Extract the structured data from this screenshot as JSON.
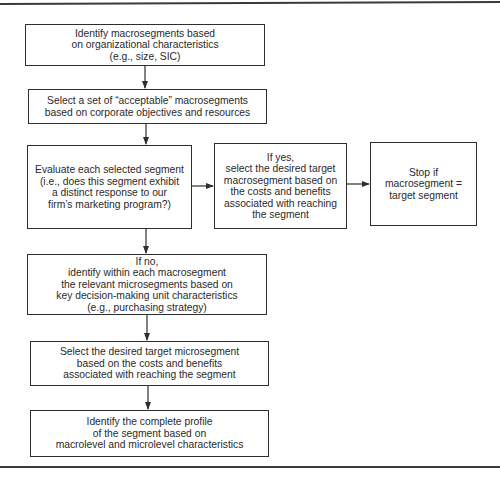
{
  "diagram": {
    "type": "flowchart",
    "nodes": [
      {
        "id": "macro",
        "text": "Identify macrosegments based\non organizational characteristics\n(e.g., size, SIC)"
      },
      {
        "id": "acceptable",
        "text": "Select a set of “acceptable” macrosegments\nbased on corporate objectives and resources"
      },
      {
        "id": "evaluate",
        "text": "Evaluate each selected segment\n(i.e., does this segment exhibit\na distinct response to our\nfirm’s marketing program?)"
      },
      {
        "id": "if_yes",
        "text": "If yes,\nselect the desired target\nmacrosegment based on\nthe costs and benefits\nassociated with reaching\nthe segment"
      },
      {
        "id": "stop",
        "text": "Stop if\nmacrosegment =\ntarget segment"
      },
      {
        "id": "if_no",
        "text": "If no,\nidentify within each macrosegment\nthe relevant microsegments based on\nkey decision-making unit characteristics\n(e.g., purchasing strategy)"
      },
      {
        "id": "micro_target",
        "text": "Select the desired target microsegment\nbased on the costs and benefits\nassociated with reaching the segment"
      },
      {
        "id": "profile",
        "text": "Identify the complete profile\nof the segment based on\nmacrolevel and microlevel characteristics"
      }
    ],
    "edges": [
      {
        "from": "macro",
        "to": "acceptable"
      },
      {
        "from": "acceptable",
        "to": "evaluate"
      },
      {
        "from": "evaluate",
        "to": "if_yes"
      },
      {
        "from": "if_yes",
        "to": "stop"
      },
      {
        "from": "evaluate",
        "to": "if_no"
      },
      {
        "from": "if_no",
        "to": "micro_target"
      },
      {
        "from": "micro_target",
        "to": "profile"
      }
    ]
  },
  "colors": {
    "line": "#2e2e2e",
    "background": "#ffffff"
  }
}
